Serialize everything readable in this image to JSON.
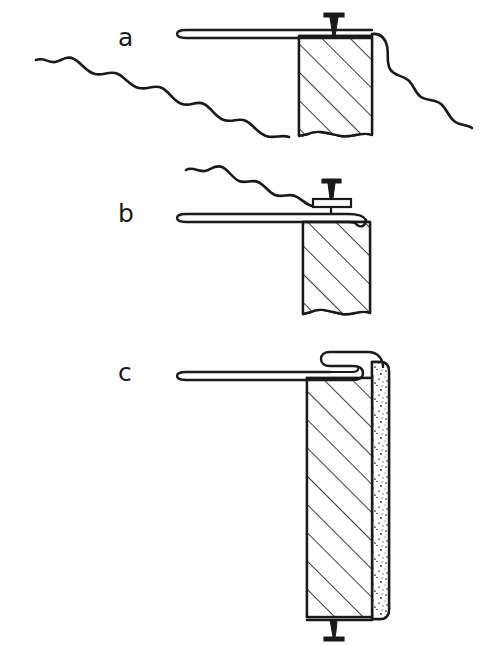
{
  "figure": {
    "background_color": "#ffffff",
    "ink_color": "#1a1a1a",
    "hatch_color": "#1a1a1a",
    "stipple_color": "#1a1a1a",
    "style": "technical line drawing"
  },
  "panels": [
    {
      "id": "a",
      "label": "a",
      "label_x": 118,
      "label_y": 46,
      "description": "Wire stapled/nailed to top of post with ground line",
      "post": {
        "name": "post-a",
        "x": 299,
        "y": 36,
        "width": 73,
        "height": 99,
        "fill_pattern": "diagonal-hatch",
        "broken_bottom": true
      },
      "wire": {
        "name": "wire-a",
        "start_x": 178,
        "end_x": 372,
        "y": 33,
        "tip": "hairpin-loop"
      },
      "fastener": {
        "name": "nail-a",
        "type": "nail",
        "x": 334,
        "head_y": 12,
        "tip_y": 36,
        "head_width": 20
      },
      "ground_lines": [
        {
          "name": "ground-line-left",
          "description": "wavy break line descending left of post"
        },
        {
          "name": "ground-line-right",
          "description": "wavy break line descending right of post"
        }
      ]
    },
    {
      "id": "b",
      "label": "b",
      "label_x": 118,
      "label_y": 222,
      "description": "Wire clamped by a flat staple plate nailed into post top",
      "post": {
        "name": "post-b",
        "x": 303,
        "y": 222,
        "width": 67,
        "height": 91,
        "fill_pattern": "diagonal-hatch",
        "broken_bottom": true
      },
      "wire": {
        "name": "wire-b",
        "start_x": 178,
        "end_x": 370,
        "y": 217,
        "tip": "hairpin-loop"
      },
      "fastener": {
        "name": "clip-nail-b",
        "type": "nail-with-clip-plate",
        "x": 331,
        "head_y": 178,
        "plate_y": 200,
        "plate_width": 36,
        "head_width": 18
      },
      "ground_lines": [
        {
          "name": "ground-line-b",
          "description": "wavy break line descending toward the post from upper left"
        }
      ]
    },
    {
      "id": "c",
      "label": "c",
      "label_x": 118,
      "label_y": 381,
      "description": "Wire looped over rounded top of a post faced with a stippled concrete layer, nailed at base",
      "post": {
        "name": "post-c",
        "x": 307,
        "y": 378,
        "width": 65,
        "height": 239,
        "fill_pattern": "diagonal-hatch",
        "broken_bottom": false
      },
      "facing": {
        "name": "stipple-facing-c",
        "x": 372,
        "y": 362,
        "width": 17,
        "height": 257,
        "fill_pattern": "stipple",
        "rounded_top": true,
        "rounded_bottom": true
      },
      "wire": {
        "name": "wire-c",
        "start_x": 178,
        "end_x": 372,
        "y": 375,
        "tip": "hairpin-loop",
        "hook": "closed-loop-over-top"
      },
      "fastener": {
        "name": "nail-c",
        "type": "inverted-nail",
        "x": 334,
        "head_y": 640,
        "tip_y": 617,
        "head_width": 20
      }
    }
  ]
}
